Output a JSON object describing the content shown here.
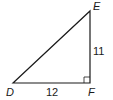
{
  "diagram": {
    "type": "right-triangle",
    "vertices": {
      "D": {
        "label": "D",
        "x": 13,
        "y": 83
      },
      "E": {
        "label": "E",
        "x": 90,
        "y": 11
      },
      "F": {
        "label": "F",
        "x": 90,
        "y": 83
      }
    },
    "sides": {
      "DF": {
        "label": "12"
      },
      "EF": {
        "label": "11"
      }
    },
    "right_angle_at": "F",
    "stroke_color": "#1a1a1a"
  }
}
